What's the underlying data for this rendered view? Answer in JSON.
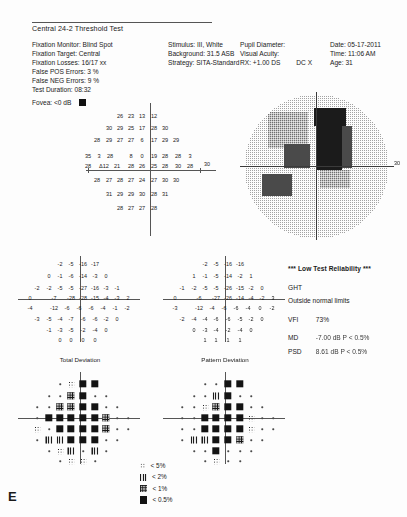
{
  "report": {
    "test_title": "Central 24-2 Threshold Test",
    "corner_mark": "E"
  },
  "header": {
    "column1": [
      "Fixation Monitor: Blind Spot",
      "Fixation Target: Central",
      "Fixation Losses: 16/17 xx",
      "False POS Errors:  3 %",
      "False NEG Errors:  9 %",
      "Test Duration: 08:32"
    ],
    "column2": [
      "Stimulus: III, White",
      "Background: 31.5 ASB",
      "Strategy: SITA-Standard"
    ],
    "column3": [
      "Pupil Diameter:",
      "Visual Acuity:",
      "RX: +1.00 DS"
    ],
    "column3_sub": [
      "",
      "",
      "DC  X"
    ],
    "column4": [
      "Date: 05-17-2011",
      "Time: 11:06 AM",
      "Age: 31"
    ],
    "fovea_label": "Fovea: <0 dB"
  },
  "threshold_plot": {
    "axis_label_right": "30",
    "blind_spot_marker": "Δ12",
    "rows": [
      {
        "y": 12,
        "values": [
          26,
          23,
          13,
          12
        ],
        "xs": [
          34,
          45,
          56,
          68
        ]
      },
      {
        "y": 24,
        "values": [
          30,
          29,
          25,
          17,
          28,
          30
        ],
        "xs": [
          23,
          34,
          45,
          56,
          68,
          79
        ]
      },
      {
        "y": 36,
        "values": [
          28,
          29,
          27,
          27,
          6,
          17,
          29,
          29
        ],
        "xs": [
          11,
          23,
          34,
          45,
          56,
          68,
          79,
          90
        ]
      },
      {
        "y": 52,
        "values": [
          35,
          3,
          28,
          8,
          0,
          19,
          28,
          28,
          3
        ],
        "xs": [
          2,
          13,
          24,
          45,
          56,
          68,
          79,
          92,
          104
        ]
      },
      {
        "y": 62,
        "values": [
          28,
          21,
          28,
          26,
          25,
          28,
          30,
          28
        ],
        "xs": [
          2,
          31,
          45,
          56,
          68,
          79,
          92,
          104
        ]
      },
      {
        "y": 76,
        "values": [
          28,
          27,
          28,
          27,
          24,
          27,
          30,
          30
        ],
        "xs": [
          11,
          23,
          34,
          45,
          56,
          68,
          79,
          90
        ]
      },
      {
        "y": 90,
        "values": [
          31,
          29,
          29,
          30,
          28,
          31
        ],
        "xs": [
          23,
          34,
          45,
          56,
          68,
          79
        ]
      },
      {
        "y": 104,
        "values": [
          28,
          27,
          27,
          28
        ],
        "xs": [
          34,
          45,
          56,
          68
        ]
      }
    ]
  },
  "greyscale": {
    "axis_label": "30"
  },
  "total_deviation_numeric": {
    "caption": "Total Deviation",
    "rows": [
      {
        "y": 8,
        "values": [
          "-2",
          "-5",
          "-16",
          "-17"
        ],
        "xs": [
          42,
          53,
          65,
          77
        ]
      },
      {
        "y": 20,
        "values": [
          "0",
          "-1",
          "-6",
          "-14",
          "-3",
          "0"
        ],
        "xs": [
          31,
          42,
          53,
          65,
          77,
          88
        ]
      },
      {
        "y": 32,
        "values": [
          "-2",
          "-2",
          "-5",
          "-5",
          "-27",
          "-16",
          "-3",
          "-1"
        ],
        "xs": [
          19,
          31,
          42,
          53,
          65,
          77,
          88,
          99
        ]
      },
      {
        "y": 42,
        "values": [
          "0",
          "-7",
          "-28",
          "-28",
          "-15",
          "-4",
          "-3",
          "2"
        ],
        "xs": [
          12,
          36,
          53,
          65,
          77,
          88,
          99,
          110
        ]
      },
      {
        "y": 52,
        "values": [
          "-4",
          "-12",
          "-6",
          "-6",
          "-6",
          "-4",
          "-1",
          "-2"
        ],
        "xs": [
          12,
          36,
          49,
          61,
          73,
          85,
          97,
          109
        ]
      },
      {
        "y": 63,
        "values": [
          "-3",
          "-5",
          "-4",
          "-7",
          "-6",
          "-6",
          "-2",
          "0"
        ],
        "xs": [
          19,
          31,
          42,
          53,
          65,
          77,
          88,
          99
        ]
      },
      {
        "y": 74,
        "values": [
          "-1",
          "-3",
          "-5",
          "-2",
          "-4",
          "0"
        ],
        "xs": [
          31,
          42,
          53,
          65,
          77,
          88
        ]
      },
      {
        "y": 84,
        "values": [
          "0",
          "0",
          "0",
          "0"
        ],
        "xs": [
          42,
          53,
          65,
          77
        ]
      }
    ]
  },
  "pattern_deviation_numeric": {
    "caption": "Pattern Deviation",
    "rows": [
      {
        "y": 8,
        "values": [
          "-2",
          "-5",
          "-16",
          "-16"
        ],
        "xs": [
          42,
          53,
          65,
          77
        ]
      },
      {
        "y": 20,
        "values": [
          "1",
          "-1",
          "-5",
          "-14",
          "-2",
          "1"
        ],
        "xs": [
          31,
          42,
          53,
          65,
          77,
          88
        ]
      },
      {
        "y": 32,
        "values": [
          "-1",
          "-2",
          "-5",
          "-5",
          "-26",
          "-15",
          "-2",
          "0"
        ],
        "xs": [
          19,
          31,
          42,
          53,
          65,
          77,
          88,
          99
        ]
      },
      {
        "y": 42,
        "values": [
          "0",
          "-6",
          "-27",
          "-26",
          "-14",
          "-4",
          "-2",
          "3"
        ],
        "xs": [
          12,
          36,
          53,
          65,
          77,
          88,
          99,
          110
        ]
      },
      {
        "y": 52,
        "values": [
          "-3",
          "-12",
          "-4",
          "-6",
          "-6",
          "-4",
          "0",
          "-2"
        ],
        "xs": [
          12,
          36,
          49,
          61,
          73,
          85,
          97,
          109
        ]
      },
      {
        "y": 63,
        "values": [
          "-2",
          "-4",
          "-4",
          "-6",
          "-6",
          "-5",
          "-2",
          "0"
        ],
        "xs": [
          19,
          31,
          42,
          53,
          65,
          77,
          88,
          99
        ]
      },
      {
        "y": 74,
        "values": [
          "0",
          "-3",
          "-4",
          "-2",
          "-4",
          "0"
        ],
        "xs": [
          31,
          42,
          53,
          65,
          77,
          88
        ]
      },
      {
        "y": 84,
        "values": [
          "1",
          "1",
          "1",
          "1"
        ],
        "xs": [
          42,
          53,
          65,
          77
        ]
      }
    ]
  },
  "total_deviation_plot": {
    "caption": "Total Deviation",
    "symbols": [
      {
        "x": 42,
        "y": 12,
        "type": "dot"
      },
      {
        "x": 53,
        "y": 12,
        "type": "p5"
      },
      {
        "x": 65,
        "y": 12,
        "type": "p05"
      },
      {
        "x": 77,
        "y": 12,
        "type": "p05"
      },
      {
        "x": 31,
        "y": 24,
        "type": "dot"
      },
      {
        "x": 42,
        "y": 24,
        "type": "dot"
      },
      {
        "x": 53,
        "y": 24,
        "type": "p1"
      },
      {
        "x": 65,
        "y": 24,
        "type": "p05"
      },
      {
        "x": 77,
        "y": 24,
        "type": "dot"
      },
      {
        "x": 88,
        "y": 24,
        "type": "dot"
      },
      {
        "x": 19,
        "y": 35,
        "type": "dot"
      },
      {
        "x": 31,
        "y": 35,
        "type": "dot"
      },
      {
        "x": 42,
        "y": 35,
        "type": "p1"
      },
      {
        "x": 53,
        "y": 35,
        "type": "p1"
      },
      {
        "x": 65,
        "y": 35,
        "type": "p05"
      },
      {
        "x": 77,
        "y": 35,
        "type": "p05"
      },
      {
        "x": 88,
        "y": 35,
        "type": "dot"
      },
      {
        "x": 99,
        "y": 35,
        "type": "dot"
      },
      {
        "x": 19,
        "y": 46,
        "type": "dot"
      },
      {
        "x": 31,
        "y": 46,
        "type": "p05"
      },
      {
        "x": 42,
        "y": 46,
        "type": "p05"
      },
      {
        "x": 53,
        "y": 46,
        "type": "p05"
      },
      {
        "x": 65,
        "y": 46,
        "type": "p05"
      },
      {
        "x": 77,
        "y": 46,
        "type": "p05"
      },
      {
        "x": 88,
        "y": 46,
        "type": "p1"
      },
      {
        "x": 99,
        "y": 46,
        "type": "dot"
      },
      {
        "x": 110,
        "y": 46,
        "type": "dot"
      },
      {
        "x": 19,
        "y": 57,
        "type": "p5"
      },
      {
        "x": 31,
        "y": 57,
        "type": "dot"
      },
      {
        "x": 42,
        "y": 57,
        "type": "p05"
      },
      {
        "x": 53,
        "y": 57,
        "type": "p05"
      },
      {
        "x": 65,
        "y": 57,
        "type": "p05"
      },
      {
        "x": 77,
        "y": 57,
        "type": "p05"
      },
      {
        "x": 88,
        "y": 57,
        "type": "p1"
      },
      {
        "x": 99,
        "y": 57,
        "type": "dot"
      },
      {
        "x": 110,
        "y": 57,
        "type": "dot"
      },
      {
        "x": 19,
        "y": 68,
        "type": "dot"
      },
      {
        "x": 31,
        "y": 68,
        "type": "p2"
      },
      {
        "x": 42,
        "y": 68,
        "type": "p2"
      },
      {
        "x": 53,
        "y": 68,
        "type": "p05"
      },
      {
        "x": 65,
        "y": 68,
        "type": "p05"
      },
      {
        "x": 77,
        "y": 68,
        "type": "p05"
      },
      {
        "x": 88,
        "y": 68,
        "type": "dot"
      },
      {
        "x": 99,
        "y": 68,
        "type": "dot"
      },
      {
        "x": 31,
        "y": 79,
        "type": "dot"
      },
      {
        "x": 42,
        "y": 79,
        "type": "p5"
      },
      {
        "x": 53,
        "y": 79,
        "type": "p2"
      },
      {
        "x": 65,
        "y": 79,
        "type": "dot"
      },
      {
        "x": 77,
        "y": 79,
        "type": "p2"
      },
      {
        "x": 88,
        "y": 79,
        "type": "dot"
      },
      {
        "x": 42,
        "y": 89,
        "type": "dot"
      },
      {
        "x": 53,
        "y": 89,
        "type": "p5"
      },
      {
        "x": 65,
        "y": 89,
        "type": "p5"
      },
      {
        "x": 77,
        "y": 89,
        "type": "dot"
      }
    ]
  },
  "pattern_deviation_plot": {
    "caption": "Pattern Deviation",
    "symbols": [
      {
        "x": 42,
        "y": 12,
        "type": "dot"
      },
      {
        "x": 53,
        "y": 12,
        "type": "dot"
      },
      {
        "x": 65,
        "y": 12,
        "type": "p05"
      },
      {
        "x": 77,
        "y": 12,
        "type": "p05"
      },
      {
        "x": 31,
        "y": 24,
        "type": "dot"
      },
      {
        "x": 42,
        "y": 24,
        "type": "dot"
      },
      {
        "x": 53,
        "y": 24,
        "type": "p2"
      },
      {
        "x": 65,
        "y": 24,
        "type": "p05"
      },
      {
        "x": 77,
        "y": 24,
        "type": "dot"
      },
      {
        "x": 88,
        "y": 24,
        "type": "dot"
      },
      {
        "x": 19,
        "y": 35,
        "type": "dot"
      },
      {
        "x": 31,
        "y": 35,
        "type": "dot"
      },
      {
        "x": 42,
        "y": 35,
        "type": "p5"
      },
      {
        "x": 53,
        "y": 35,
        "type": "p1"
      },
      {
        "x": 65,
        "y": 35,
        "type": "p05"
      },
      {
        "x": 77,
        "y": 35,
        "type": "p05"
      },
      {
        "x": 88,
        "y": 35,
        "type": "dot"
      },
      {
        "x": 99,
        "y": 35,
        "type": "dot"
      },
      {
        "x": 19,
        "y": 46,
        "type": "dot"
      },
      {
        "x": 31,
        "y": 46,
        "type": "dot"
      },
      {
        "x": 42,
        "y": 46,
        "type": "p05"
      },
      {
        "x": 53,
        "y": 46,
        "type": "p05"
      },
      {
        "x": 65,
        "y": 46,
        "type": "p05"
      },
      {
        "x": 77,
        "y": 46,
        "type": "p05"
      },
      {
        "x": 88,
        "y": 46,
        "type": "p5"
      },
      {
        "x": 99,
        "y": 46,
        "type": "dot"
      },
      {
        "x": 110,
        "y": 46,
        "type": "dot"
      },
      {
        "x": 19,
        "y": 57,
        "type": "dot"
      },
      {
        "x": 31,
        "y": 57,
        "type": "dot"
      },
      {
        "x": 42,
        "y": 57,
        "type": "p05"
      },
      {
        "x": 53,
        "y": 57,
        "type": "p05"
      },
      {
        "x": 65,
        "y": 57,
        "type": "p05"
      },
      {
        "x": 77,
        "y": 57,
        "type": "p05"
      },
      {
        "x": 88,
        "y": 57,
        "type": "p5"
      },
      {
        "x": 99,
        "y": 57,
        "type": "dot"
      },
      {
        "x": 110,
        "y": 57,
        "type": "dot"
      },
      {
        "x": 19,
        "y": 68,
        "type": "dot"
      },
      {
        "x": 31,
        "y": 68,
        "type": "p2"
      },
      {
        "x": 42,
        "y": 68,
        "type": "p2"
      },
      {
        "x": 53,
        "y": 68,
        "type": "p05"
      },
      {
        "x": 65,
        "y": 68,
        "type": "p05"
      },
      {
        "x": 77,
        "y": 68,
        "type": "p1"
      },
      {
        "x": 88,
        "y": 68,
        "type": "dot"
      },
      {
        "x": 99,
        "y": 68,
        "type": "dot"
      },
      {
        "x": 31,
        "y": 79,
        "type": "dot"
      },
      {
        "x": 42,
        "y": 79,
        "type": "dot"
      },
      {
        "x": 53,
        "y": 79,
        "type": "p05"
      },
      {
        "x": 65,
        "y": 79,
        "type": "dot"
      },
      {
        "x": 77,
        "y": 79,
        "type": "dot"
      },
      {
        "x": 88,
        "y": 79,
        "type": "dot"
      },
      {
        "x": 53,
        "y": 89,
        "type": "p5"
      },
      {
        "x": 65,
        "y": 89,
        "type": "dot"
      },
      {
        "x": 42,
        "y": 89,
        "type": "dot"
      },
      {
        "x": 77,
        "y": 89,
        "type": "dot"
      }
    ]
  },
  "results": {
    "reliability_flag": "*** Low Test Reliability ***",
    "ght_label": "GHT",
    "ght_value": "Outside normal limits",
    "vfi_key": "VFI",
    "vfi_value": "73%",
    "md_key": "MD",
    "md_value": "-7.00 dB P < 0.5%",
    "psd_key": "PSD",
    "psd_value": "8.61 dB P < 0.5%"
  },
  "probability_legend": [
    {
      "symbol": "p5",
      "label": "< 5%"
    },
    {
      "symbol": "p2",
      "label": "< 2%"
    },
    {
      "symbol": "p1",
      "label": "< 1%"
    },
    {
      "symbol": "p05",
      "label": "< 0.5%"
    }
  ]
}
